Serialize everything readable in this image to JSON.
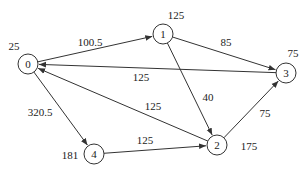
{
  "diagram": {
    "type": "directed-weighted-graph",
    "nodes": [
      {
        "id": "0",
        "label": "0",
        "value": "25",
        "x": 28,
        "y": 64,
        "vx": 14,
        "vy": 46
      },
      {
        "id": "1",
        "label": "1",
        "value": "125",
        "x": 163,
        "y": 34,
        "vx": 176,
        "vy": 15
      },
      {
        "id": "2",
        "label": "2",
        "value": "175",
        "x": 217,
        "y": 145,
        "vx": 249,
        "vy": 146
      },
      {
        "id": "3",
        "label": "3",
        "value": "75",
        "x": 286,
        "y": 73,
        "vx": 293,
        "vy": 53
      },
      {
        "id": "4",
        "label": "4",
        "value": "181",
        "x": 94,
        "y": 154,
        "vx": 70,
        "vy": 155
      }
    ],
    "edges": [
      {
        "from": "0",
        "to": "1",
        "weight": "100.5",
        "lx": 90,
        "ly": 42
      },
      {
        "from": "1",
        "to": "3",
        "weight": "85",
        "lx": 226,
        "ly": 42
      },
      {
        "from": "3",
        "to": "0",
        "weight": "125",
        "lx": 141,
        "ly": 77
      },
      {
        "from": "1",
        "to": "2",
        "weight": "40",
        "lx": 208,
        "ly": 97
      },
      {
        "from": "0",
        "to": "4",
        "weight": "320.5",
        "lx": 40,
        "ly": 112
      },
      {
        "from": "2",
        "to": "0",
        "weight": "125",
        "lx": 153,
        "ly": 106
      },
      {
        "from": "4",
        "to": "2",
        "weight": "125",
        "lx": 145,
        "ly": 140
      },
      {
        "from": "2",
        "to": "3",
        "weight": "75",
        "lx": 265,
        "ly": 113
      }
    ]
  }
}
